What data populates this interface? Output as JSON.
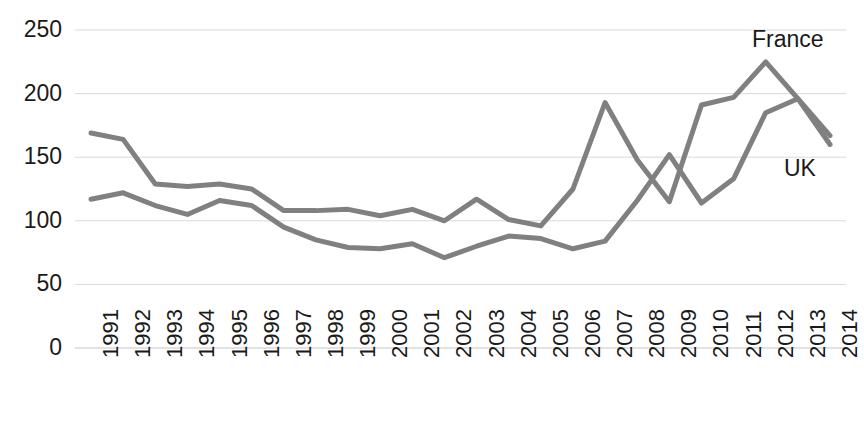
{
  "chart_data": {
    "type": "line",
    "title": "",
    "subtitle": "",
    "xlabel": "",
    "ylabel": "",
    "grid": true,
    "legend_position": "inline-annotations",
    "ylim": [
      0,
      250
    ],
    "yticks": [
      0,
      50,
      100,
      150,
      200,
      250
    ],
    "ytick_labels": [
      "0",
      "50",
      "100",
      "150",
      "200",
      "250"
    ],
    "categories": [
      "1991",
      "1992",
      "1993",
      "1994",
      "1995",
      "1996",
      "1997",
      "1998",
      "1999",
      "2000",
      "2001",
      "2002",
      "2003",
      "2004",
      "2005",
      "2006",
      "2007",
      "2008",
      "2009",
      "2010",
      "2011",
      "2012",
      "2013",
      "2014"
    ],
    "series": [
      {
        "name": "France",
        "color": "#808080",
        "values": [
          169,
          164,
          129,
          127,
          129,
          125,
          108,
          108,
          109,
          104,
          109,
          100,
          117,
          101,
          96,
          125,
          193,
          148,
          115,
          191,
          197,
          225,
          196,
          167
        ]
      },
      {
        "name": "UK",
        "color": "#808080",
        "values": [
          117,
          122,
          112,
          105,
          116,
          112,
          95,
          85,
          79,
          78,
          82,
          71,
          80,
          88,
          86,
          78,
          84,
          116,
          152,
          114,
          133,
          185,
          196,
          160
        ]
      }
    ],
    "annotations": [
      {
        "text": "France",
        "series": "France"
      },
      {
        "text": "UK",
        "series": "UK"
      }
    ]
  },
  "axis": {
    "y_labels": [
      "250",
      "200",
      "150",
      "100",
      "50",
      "0"
    ],
    "x_labels": [
      "1991",
      "1992",
      "1993",
      "1994",
      "1995",
      "1996",
      "1997",
      "1998",
      "1999",
      "2000",
      "2001",
      "2002",
      "2003",
      "2004",
      "2005",
      "2006",
      "2007",
      "2008",
      "2009",
      "2010",
      "2011",
      "2012",
      "2013",
      "2014"
    ]
  },
  "labels": {
    "france": "France",
    "uk": "UK"
  },
  "colors": {
    "line": "#808080",
    "grid": "#d9d9d9",
    "text": "#1a1a1a",
    "background": "#ffffff"
  }
}
